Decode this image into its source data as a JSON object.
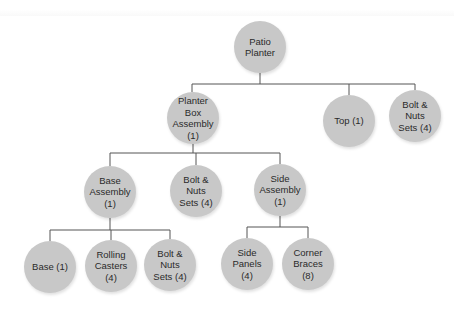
{
  "diagram": {
    "type": "tree",
    "title": "Patio Planter",
    "line_color": "#555555",
    "node_color": "#c8c8c8",
    "nodes": [
      {
        "id": "root",
        "label": "Patio\nPlanter",
        "x": 260,
        "y": 47,
        "parent": null
      },
      {
        "id": "planter_box",
        "label": "Planter\nBox\nAssembly\n(1)",
        "x": 193,
        "y": 118,
        "parent": "root"
      },
      {
        "id": "top",
        "label": "Top (1)",
        "x": 349,
        "y": 121,
        "parent": "root"
      },
      {
        "id": "bolts_top",
        "label": "Bolt &\nNuts\nSets (4)",
        "x": 415,
        "y": 116,
        "parent": "root"
      },
      {
        "id": "base_assembly",
        "label": "Base\nAssembly\n(1)",
        "x": 110,
        "y": 192,
        "parent": "planter_box"
      },
      {
        "id": "bolts_mid",
        "label": "Bolt &\nNuts\nSets (4)",
        "x": 196,
        "y": 191,
        "parent": "planter_box"
      },
      {
        "id": "side_assembly",
        "label": "Side\nAssembly\n(1)",
        "x": 280,
        "y": 190,
        "parent": "planter_box"
      },
      {
        "id": "base",
        "label": "Base (1)",
        "x": 50,
        "y": 267,
        "parent": "base_assembly"
      },
      {
        "id": "casters",
        "label": "Rolling\nCasters\n(4)",
        "x": 111,
        "y": 266,
        "parent": "base_assembly"
      },
      {
        "id": "bolts_low",
        "label": "Bolt &\nNuts\nSets (4)",
        "x": 170,
        "y": 265,
        "parent": "base_assembly"
      },
      {
        "id": "side_panels",
        "label": "Side\nPanels\n(4)",
        "x": 247,
        "y": 264,
        "parent": "side_assembly"
      },
      {
        "id": "corner_braces",
        "label": "Corner\nBraces\n(8)",
        "x": 308,
        "y": 264,
        "parent": "side_assembly"
      }
    ]
  }
}
